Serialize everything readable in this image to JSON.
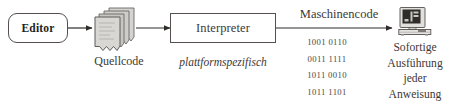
{
  "diagram": {
    "background_color": "#ffffff",
    "stroke_color": "#55504e",
    "text_color": "#3c3938"
  },
  "nodes": {
    "editor": {
      "label": "Editor",
      "shape": "rounded-rectangle",
      "bold": true
    },
    "source_code": {
      "icon": "document-stack-icon",
      "caption": "Quellcode"
    },
    "interpreter": {
      "label": "Interpreter",
      "shape": "rectangle",
      "note": "plattformspezifisch"
    },
    "machine_code": {
      "label": "Maschinencode",
      "lines": [
        "1001 0110",
        "0011 1111",
        "1011 0010",
        "1011 1101"
      ]
    },
    "computer": {
      "icon": "desktop-computer-icon",
      "caption_lines": [
        "Sofortige",
        "Ausführung",
        "jeder",
        "Anweisung"
      ]
    }
  },
  "connectors": [
    {
      "name": "editor-to-source",
      "from": "editor",
      "to": "source_code",
      "style": "arrow"
    },
    {
      "name": "source-to-interpreter",
      "from": "source_code",
      "to": "interpreter",
      "style": "arrow"
    },
    {
      "name": "interpreter-to-computer",
      "from": "interpreter",
      "to": "computer",
      "style": "arrow",
      "label": "Maschinencode"
    }
  ]
}
